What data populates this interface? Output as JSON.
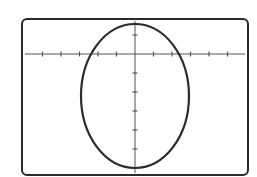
{
  "screen": {
    "description": "Graphing calculator display showing an ellipse plotted on coordinate axes"
  },
  "style": {
    "frame_color": "#2a2a2a",
    "axis_color": "#555555",
    "curve_color": "#2b2b2b",
    "background": "#ffffff"
  },
  "chart_data": {
    "type": "line",
    "title": "",
    "xlabel": "",
    "ylabel": "",
    "grid": false,
    "legend": null,
    "curve": {
      "shape": "ellipse",
      "center": [
        0,
        -2.2
      ],
      "semi_axis_x": 2.9,
      "semi_axis_y": 3.8,
      "top_y": 1.6,
      "bottom_y": -6.0,
      "x_intercepts": [
        -2.3,
        2.3
      ]
    },
    "x_ticks": [
      -5,
      -4,
      -3,
      -2,
      -1,
      1,
      2,
      3,
      4,
      5
    ],
    "y_ticks": [
      1,
      -1,
      -2,
      -3,
      -4,
      -5
    ],
    "xlim": [
      -6,
      6
    ],
    "ylim": [
      -6.4,
      1.8
    ],
    "tick_labels_shown": false
  },
  "layout_px": {
    "frame": {
      "x": 22,
      "y": 19,
      "w": 226,
      "h": 156,
      "r": 5
    },
    "origin": {
      "x": 135,
      "y": 54
    },
    "x_unit_px": 18.5,
    "y_unit_px": 19,
    "ellipse": {
      "cx": 135,
      "cy": 96,
      "rx": 54,
      "ry": 72
    },
    "x_axis": {
      "x1": 25,
      "x2": 245
    },
    "y_axis": {
      "y1": 21,
      "y2": 173
    }
  }
}
